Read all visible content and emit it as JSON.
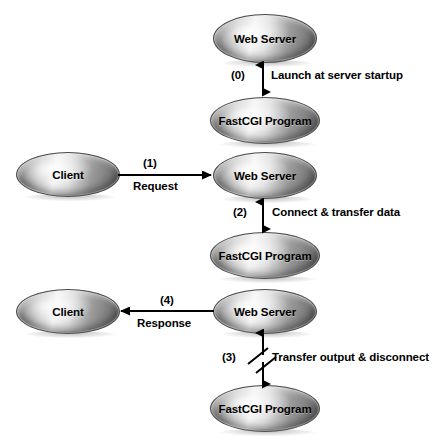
{
  "diagram": {
    "background_color": "#ffffff",
    "text_color": "#000000",
    "nodes": [
      {
        "id": "web-server-1",
        "label": "Web Server",
        "x": 213,
        "y": 14,
        "w": 104,
        "h": 49
      },
      {
        "id": "fastcgi-1",
        "label": "FastCGI Program",
        "x": 210,
        "y": 97,
        "w": 110,
        "h": 47
      },
      {
        "id": "client-1",
        "label": "Client",
        "x": 16,
        "y": 152,
        "w": 104,
        "h": 45
      },
      {
        "id": "web-server-2",
        "label": "Web Server",
        "x": 213,
        "y": 152,
        "w": 104,
        "h": 47
      },
      {
        "id": "fastcgi-2",
        "label": "FastCGI Program",
        "x": 210,
        "y": 232,
        "w": 110,
        "h": 47
      },
      {
        "id": "client-2",
        "label": "Client",
        "x": 16,
        "y": 289,
        "w": 104,
        "h": 45
      },
      {
        "id": "web-server-3",
        "label": "Web Server",
        "x": 213,
        "y": 289,
        "w": 104,
        "h": 45
      },
      {
        "id": "fastcgi-3",
        "label": "FastCGI Program",
        "x": 210,
        "y": 385,
        "w": 110,
        "h": 47
      }
    ],
    "connections": [
      {
        "id": "conn-0",
        "step": "(0)",
        "text": "Launch at server startup",
        "kind": "vertical-bidirectional",
        "step_x": 231,
        "step_y": 69,
        "text_x": 271,
        "text_y": 69
      },
      {
        "id": "conn-1",
        "step": "(1)",
        "text": "Request",
        "kind": "horizontal-right",
        "step_x": 143,
        "step_y": 157,
        "text_x": 133,
        "text_y": 181
      },
      {
        "id": "conn-2",
        "step": "(2)",
        "text": "Connect & transfer data",
        "kind": "vertical-bidirectional",
        "step_x": 233,
        "step_y": 206,
        "text_x": 272,
        "text_y": 206
      },
      {
        "id": "conn-3",
        "step": "(3)",
        "text": "Transfer output & disconnect",
        "kind": "vertical-bidirectional-broken",
        "step_x": 222,
        "step_y": 351,
        "text_x": 272,
        "text_y": 351
      },
      {
        "id": "conn-4",
        "step": "(4)",
        "text": "Response",
        "kind": "horizontal-left",
        "step_x": 160,
        "step_y": 294,
        "text_x": 137,
        "text_y": 317
      }
    ]
  }
}
